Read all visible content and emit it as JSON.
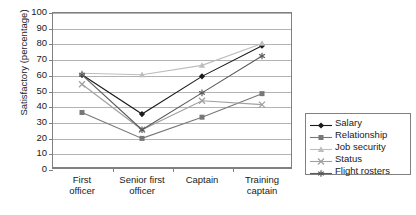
{
  "chart_data": {
    "type": "line",
    "title": "",
    "subtitle": "",
    "xlabel": "",
    "ylabel": "Satisfactory (percentage)",
    "categories": [
      "First officer",
      "Senior first officer",
      "Captain",
      "Training captain"
    ],
    "category_lines": [
      [
        "First",
        "officer"
      ],
      [
        "Senior first",
        "officer"
      ],
      [
        "Captain",
        ""
      ],
      [
        "Training",
        "captain"
      ]
    ],
    "ylim": [
      0,
      100
    ],
    "yticks": [
      100,
      90,
      80,
      70,
      60,
      50,
      40,
      30,
      20,
      10,
      0
    ],
    "grid": "horizontal",
    "legend_position": "right",
    "series": [
      {
        "name": "Salary",
        "marker": "diamond",
        "color": "#1a1a1a",
        "values": [
          60,
          35,
          59,
          78.5
        ]
      },
      {
        "name": "Relationship",
        "marker": "square",
        "color": "#777777",
        "values": [
          36,
          19.5,
          33,
          48
        ]
      },
      {
        "name": "Job security",
        "marker": "triangle",
        "color": "#bdbdbd",
        "values": [
          61,
          60,
          66,
          80
        ]
      },
      {
        "name": "Status",
        "marker": "cross",
        "color": "#a0a0a0",
        "values": [
          54,
          25,
          43.5,
          41
        ]
      },
      {
        "name": "Flight rosters",
        "marker": "asterisk",
        "color": "#5a5a5a",
        "values": [
          60,
          25,
          48.5,
          72
        ]
      }
    ]
  },
  "axes": {
    "y_title": "Satisfactory (percentage)",
    "y_tick_labels": [
      "100",
      "90",
      "80",
      "70",
      "60",
      "50",
      "40",
      "30",
      "20",
      "10",
      "0"
    ]
  },
  "legend": {
    "entries": [
      {
        "label": "Salary"
      },
      {
        "label": "Relationship"
      },
      {
        "label": "Job security"
      },
      {
        "label": "Status"
      },
      {
        "label": "Flight rosters"
      }
    ]
  },
  "colors": {
    "grid": "#b3b3b3",
    "frame": "#808080",
    "text": "#1a1a1a",
    "background": "#ffffff"
  }
}
